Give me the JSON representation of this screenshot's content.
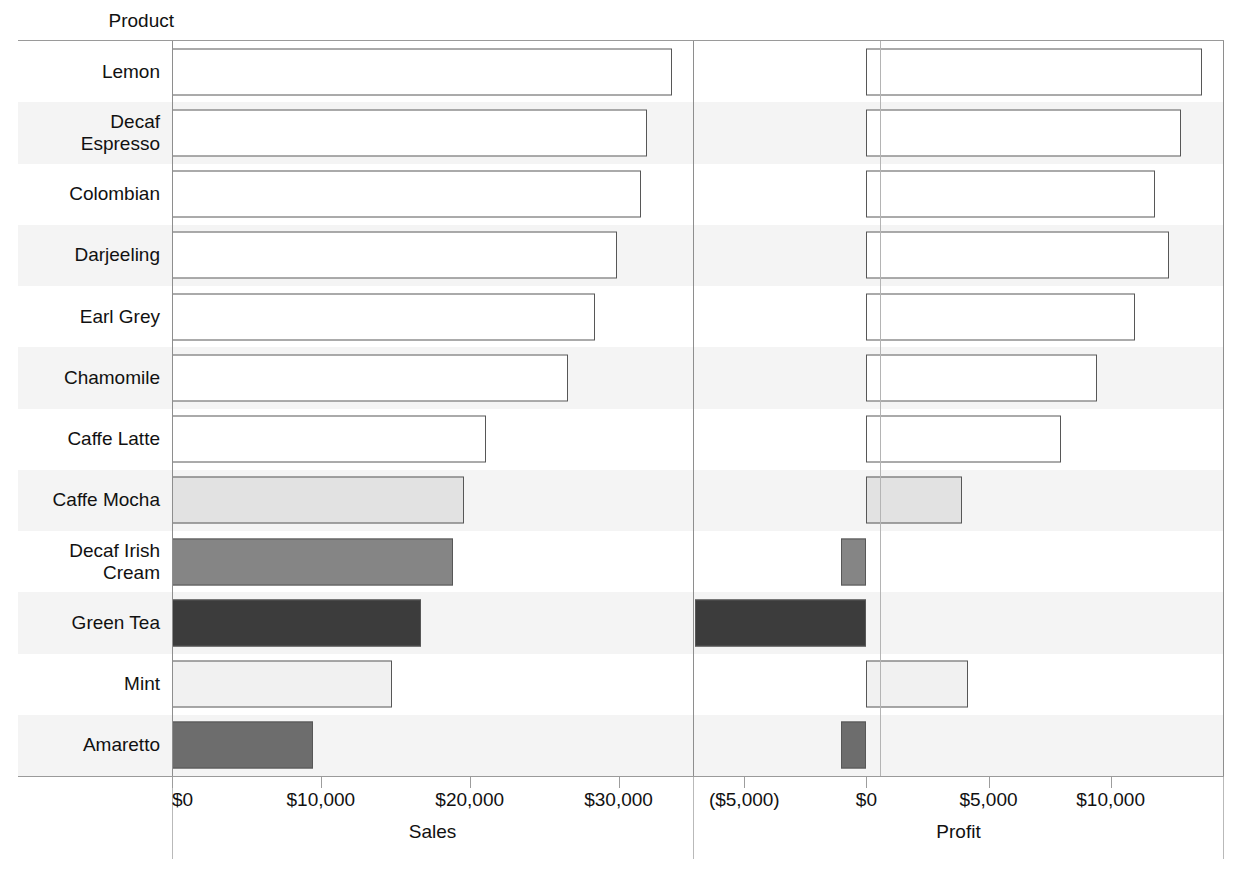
{
  "header": {
    "row_field_label": "Product"
  },
  "chart_data": {
    "type": "bar",
    "orientation": "horizontal",
    "title": "",
    "subtitle": "",
    "ylabel": "Product",
    "grid": false,
    "legend": "none",
    "categories": [
      "Lemon",
      "Decaf Espresso",
      "Colombian",
      "Darjeeling",
      "Earl Grey",
      "Chamomile",
      "Caffe Latte",
      "Caffe Mocha",
      "Decaf Irish Cream",
      "Green Tea",
      "Mint",
      "Amaretto"
    ],
    "panels": [
      {
        "name": "Sales",
        "xlabel": "Sales",
        "xlim": [
          0,
          35000
        ],
        "ticks": [
          0,
          10000,
          20000,
          30000
        ],
        "ticklabels": [
          "$0",
          "$10,000",
          "$20,000",
          "$30,000"
        ],
        "values": [
          33600,
          31900,
          31500,
          29900,
          28400,
          26600,
          21100,
          19600,
          18900,
          16700,
          14800,
          9500
        ]
      },
      {
        "name": "Profit",
        "xlabel": "Profit",
        "xlim": [
          -7100,
          14600
        ],
        "ticks": [
          -5000,
          0,
          5000,
          10000
        ],
        "ticklabels": [
          "($5,000)",
          "$0",
          "$5,000",
          "$10,000"
        ],
        "values": [
          13750,
          12900,
          11800,
          12400,
          11000,
          9450,
          7950,
          3900,
          -1060,
          -7020,
          4150,
          -1020
        ]
      }
    ],
    "bar_fills": [
      "#ffffff",
      "#ffffff",
      "#ffffff",
      "#ffffff",
      "#ffffff",
      "#ffffff",
      "#ffffff",
      "#e2e2e2",
      "#858585",
      "#3c3c3c",
      "#f1f1f1",
      "#6d6d6d"
    ],
    "bar_border_color": "#575757",
    "band_color": "#f4f4f4",
    "axis_color": "#9a9a9a"
  }
}
